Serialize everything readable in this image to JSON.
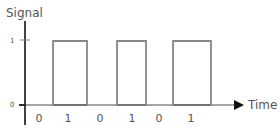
{
  "diagram": {
    "y_axis_label": "Signal",
    "x_axis_label": "Time",
    "y_ticks": [
      {
        "label": "1",
        "y": 40
      },
      {
        "label": "0",
        "y": 105
      }
    ],
    "bits": [
      {
        "label": "0",
        "x": 39
      },
      {
        "label": "1",
        "x": 68
      },
      {
        "label": "0",
        "x": 100
      },
      {
        "label": "1",
        "x": 132
      },
      {
        "label": "0",
        "x": 159
      },
      {
        "label": "1",
        "x": 191
      }
    ],
    "pulses": [
      {
        "x1": 53,
        "x2": 87
      },
      {
        "x1": 117,
        "x2": 146
      },
      {
        "x1": 173,
        "x2": 211
      }
    ],
    "colors": {
      "axis": "#111111",
      "signal": "#888888",
      "signal_low": "#333333",
      "text": "#555555"
    }
  }
}
